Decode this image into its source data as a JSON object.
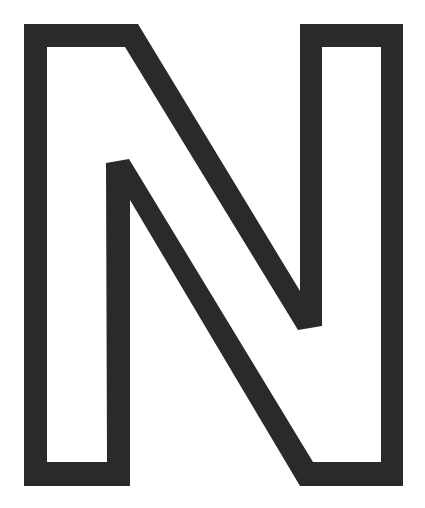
{
  "figure": {
    "letter": "N",
    "style": "hollow outline",
    "colors": {
      "background": "#ffffff",
      "outline": "#2a2a2a"
    },
    "outer_contour": [
      [
        24,
        24
      ],
      [
        138,
        24
      ],
      [
        300,
        291
      ],
      [
        300,
        24
      ],
      [
        403,
        24
      ],
      [
        403,
        486
      ],
      [
        300,
        486
      ],
      [
        130,
        200
      ],
      [
        130,
        486
      ],
      [
        24,
        486
      ]
    ],
    "inner_contour": [
      [
        47,
        47
      ],
      [
        125,
        47
      ],
      [
        298,
        330
      ],
      [
        322,
        326
      ],
      [
        322,
        47
      ],
      [
        381,
        47
      ],
      [
        381,
        462
      ],
      [
        313,
        462
      ],
      [
        129,
        159
      ],
      [
        106,
        163
      ],
      [
        107,
        462
      ],
      [
        47,
        462
      ]
    ]
  }
}
